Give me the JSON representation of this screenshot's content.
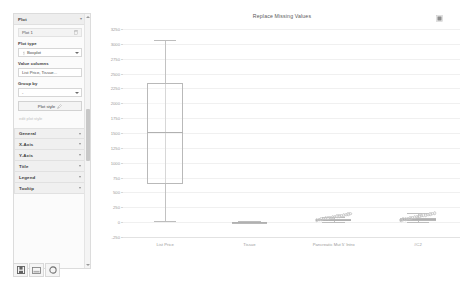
{
  "sidebar": {
    "panel_title": "Plot",
    "panel_collapse_icon": "chevron-icon",
    "plot_item_label": "Plot 1",
    "delete_icon": "trash-icon",
    "fields": {
      "plot_type_label": "Plot type",
      "plot_type_value": "Boxplot",
      "value_columns_label": "Value columns",
      "value_columns_value": "List Price, Tissue...",
      "group_by_label": "Group by",
      "group_by_value": "-"
    },
    "plot_style_button": "Plot style",
    "plot_style_icon": "brush-icon",
    "hint_text": "edit plot style",
    "accordions": [
      {
        "label": "General",
        "icon": "chevron-down-icon"
      },
      {
        "label": "X-Axis",
        "icon": "chevron-down-icon"
      },
      {
        "label": "Y-Axis",
        "icon": "chevron-down-icon"
      },
      {
        "label": "Title",
        "icon": "chevron-down-icon"
      },
      {
        "label": "Legend",
        "icon": "chevron-down-icon"
      },
      {
        "label": "Tooltip",
        "icon": "chevron-down-icon"
      }
    ]
  },
  "toolbar": {
    "buttons": [
      {
        "name": "save-button",
        "icon": "floppy-disk-icon"
      },
      {
        "name": "export-image-button",
        "icon": "image-icon"
      },
      {
        "name": "refresh-button",
        "icon": "refresh-circle-icon"
      }
    ]
  },
  "chart_menu_icon": "grid-menu-icon",
  "chart_data": {
    "type": "box",
    "title": "Replace Missing Values",
    "xlabel": "",
    "ylabel": "",
    "grid": true,
    "legend": false,
    "ylim": [
      -250,
      3250
    ],
    "yticks": [
      -250,
      0,
      250,
      500,
      750,
      1000,
      1250,
      1500,
      1750,
      2000,
      2250,
      2500,
      2750,
      3000,
      3250
    ],
    "ytick_labels": [
      "-250",
      "0",
      "250",
      "500",
      "750",
      "1000",
      "1250",
      "1500",
      "1750",
      "2000",
      "2250",
      "2500",
      "2750",
      "3000",
      "3250"
    ],
    "categories": [
      "List Price",
      "Tissue",
      "Pancreatic Mut 5' Intro",
      "#C2"
    ],
    "boxes": [
      {
        "category": "List Price",
        "min": 25,
        "q1": 645,
        "median": 1520,
        "q3": 2340,
        "max": 3070,
        "outliers": []
      },
      {
        "category": "Tissue",
        "min": 0,
        "q1": 0,
        "median": 2,
        "q3": 6,
        "max": 12,
        "outliers": []
      },
      {
        "category": "Pancreatic Mut 5' Intro",
        "min": 8,
        "q1": 18,
        "median": 38,
        "q3": 60,
        "max": 92,
        "outliers": [
          30,
          42,
          48,
          55,
          62,
          70,
          78,
          84,
          90,
          96,
          102,
          110,
          118,
          126,
          134,
          142
        ]
      },
      {
        "category": "#C2",
        "min": 10,
        "q1": 26,
        "median": 52,
        "q3": 78,
        "max": 150,
        "outliers": [
          34,
          46,
          54,
          61,
          68,
          75,
          82,
          90,
          97,
          105,
          112,
          120,
          128,
          136,
          144,
          152
        ]
      }
    ]
  }
}
